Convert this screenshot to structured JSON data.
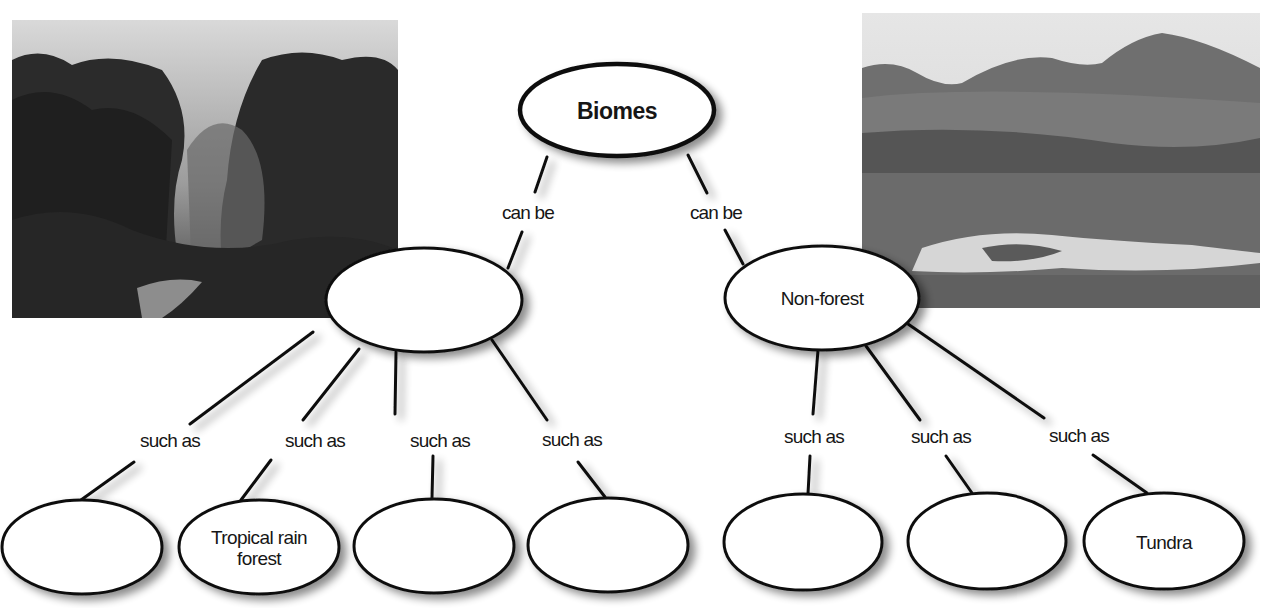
{
  "photos": {
    "left": {
      "subject": "tropical rain forest photo",
      "x": 12,
      "y": 20,
      "w": 386,
      "h": 298
    },
    "right": {
      "subject": "tundra landscape photo",
      "x": 862,
      "y": 13,
      "w": 398,
      "h": 295
    }
  },
  "concept_map": {
    "root": {
      "label": "Biomes",
      "cx": 617,
      "cy": 110,
      "rx": 97,
      "ry": 46
    },
    "categories": [
      {
        "id": "forest",
        "label": "",
        "cx": 424,
        "cy": 300,
        "rx": 98,
        "ry": 52,
        "link_label": "can be"
      },
      {
        "id": "non-forest",
        "label": "Non-forest",
        "cx": 822,
        "cy": 298,
        "rx": 97,
        "ry": 52,
        "link_label": "can be"
      }
    ],
    "examples": [
      {
        "parent": "forest",
        "label": "",
        "cx": 82,
        "cy": 547,
        "rx": 80,
        "ry": 47,
        "link_label": "such as"
      },
      {
        "parent": "forest",
        "label": "Tropical rain forest",
        "line1": "Tropical rain",
        "line2": "forest",
        "cx": 259,
        "cy": 547,
        "rx": 80,
        "ry": 47,
        "link_label": "such as"
      },
      {
        "parent": "forest",
        "label": "",
        "cx": 434,
        "cy": 546,
        "rx": 80,
        "ry": 47,
        "link_label": "such as"
      },
      {
        "parent": "forest",
        "label": "",
        "cx": 608,
        "cy": 545,
        "rx": 80,
        "ry": 47,
        "link_label": "such as"
      },
      {
        "parent": "non-forest",
        "label": "",
        "cx": 803,
        "cy": 542,
        "rx": 79,
        "ry": 48,
        "link_label": "such as"
      },
      {
        "parent": "non-forest",
        "label": "",
        "cx": 987,
        "cy": 541,
        "rx": 79,
        "ry": 48,
        "link_label": "such as"
      },
      {
        "parent": "non-forest",
        "label": "Tundra",
        "cx": 1164,
        "cy": 541,
        "rx": 80,
        "ry": 48,
        "link_label": "such as"
      }
    ]
  },
  "colors": {
    "stroke": "#111111",
    "fill": "#ffffff",
    "text": "#161616",
    "shadow": "#9a9a9a"
  }
}
